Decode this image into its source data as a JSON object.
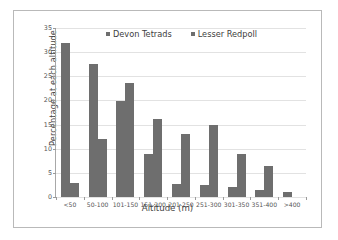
{
  "chart_data": {
    "type": "bar",
    "title": "",
    "xlabel": "Altitude (m)",
    "ylabel": "Percentage at each altitude",
    "categories": [
      "<50",
      "50-100",
      "101-150",
      "151-200",
      "201-250",
      "251-300",
      "301-350",
      "351-400",
      ">400"
    ],
    "series": [
      {
        "name": "Devon Tetrads",
        "color": "#6e6e6e",
        "values": [
          32.0,
          27.6,
          19.8,
          8.9,
          2.6,
          2.5,
          2.0,
          1.4,
          1.1
        ]
      },
      {
        "name": "Lesser Redpoll",
        "color": "#6e6e6e",
        "values": [
          3.0,
          12.0,
          23.6,
          16.2,
          13.1,
          14.9,
          8.9,
          6.4,
          0.0
        ]
      }
    ],
    "ylim": [
      0,
      35
    ],
    "yticks": [
      0,
      5,
      10,
      15,
      20,
      25,
      30,
      35
    ],
    "ytick_labels": [
      "0",
      "5",
      "10",
      "15",
      "20",
      "25",
      "30",
      "35"
    ],
    "grid": true,
    "legend_position": "top-center"
  },
  "legend": {
    "entries": [
      {
        "label": "Devon Tetrads"
      },
      {
        "label": "Lesser Redpoll"
      }
    ]
  }
}
